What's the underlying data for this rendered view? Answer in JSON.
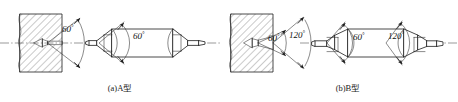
{
  "figure": {
    "background_color": "#ffffff",
    "line_color": "#1c1c1c",
    "text_color": "#111111",
    "width": 458,
    "height": 102
  },
  "panels": [
    {
      "id": "a",
      "caption": "(a)A型",
      "caption_x": 120,
      "caption_y": 90,
      "workpiece": {
        "label": "sectioned workpiece with A-type center hole",
        "hatch_angle_deg": 45
      },
      "angles": [
        {
          "value": "60",
          "symbol": "°",
          "x": 62,
          "y": 32
        }
      ],
      "tool_angles": [
        {
          "value": "60",
          "symbol": "°",
          "x": 136,
          "y": 38
        }
      ]
    },
    {
      "id": "b",
      "caption": "(b)B型",
      "caption_x": 348,
      "caption_y": 90,
      "workpiece": {
        "label": "sectioned workpiece with B-type center hole",
        "hatch_angle_deg": 45
      },
      "angles": [
        {
          "value": "60",
          "symbol": "°",
          "x": 271,
          "y": 41
        },
        {
          "value": "120",
          "symbol": "°",
          "x": 294,
          "y": 38
        }
      ],
      "tool_angles": [
        {
          "value": "60",
          "symbol": "°",
          "x": 356,
          "y": 40
        },
        {
          "value": "120",
          "symbol": "°",
          "x": 392,
          "y": 39
        }
      ]
    }
  ],
  "labels": {
    "degree_symbol": "°",
    "caption_a": "(a)A型",
    "caption_b": "(b)B型",
    "angle_60": "60",
    "angle_120": "120"
  }
}
